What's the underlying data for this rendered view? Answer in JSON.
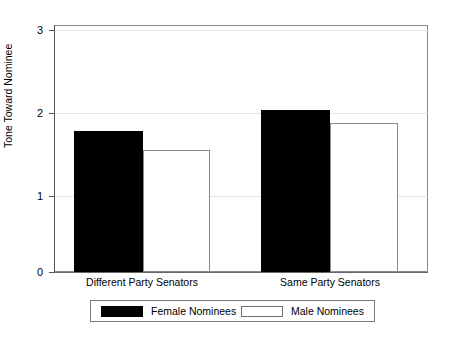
{
  "chart_data": {
    "type": "bar",
    "title": "",
    "xlabel": "",
    "ylabel": "Tone Toward Nominee",
    "categories": [
      "Different Party Senators",
      "Same Party Senators"
    ],
    "series": [
      {
        "name": "Female Nominees",
        "values": [
          1.74,
          2.0
        ],
        "color": "#000000",
        "fill": "solid"
      },
      {
        "name": "Male Nominees",
        "values": [
          1.51,
          1.84
        ],
        "color": "#ffffff",
        "fill": "hollow"
      }
    ],
    "ylim": [
      0,
      3.05
    ],
    "yticks": [
      0,
      1,
      2,
      3
    ],
    "ytick_labels": [
      "0",
      "1",
      "2",
      "3"
    ],
    "grid": "horizontal",
    "gridlines_at": [
      1,
      2,
      3
    ],
    "legend_position": "below-axis",
    "frame": "box"
  },
  "axes": {
    "y_title": "Tone Toward Nominee",
    "y_ticks": [
      {
        "label": "3",
        "value": 3
      },
      {
        "label": "2",
        "value": 2
      },
      {
        "label": "1",
        "value": 1
      },
      {
        "label": "0",
        "value": 0
      }
    ]
  },
  "legend": {
    "entries": [
      {
        "label": "Female Nominees",
        "swatch": "solid-black-swatch"
      },
      {
        "label": "Male Nominees",
        "swatch": "hollow-white-swatch"
      }
    ]
  },
  "categories": [
    {
      "label": "Different Party Senators"
    },
    {
      "label": "Same Party Senators"
    }
  ]
}
